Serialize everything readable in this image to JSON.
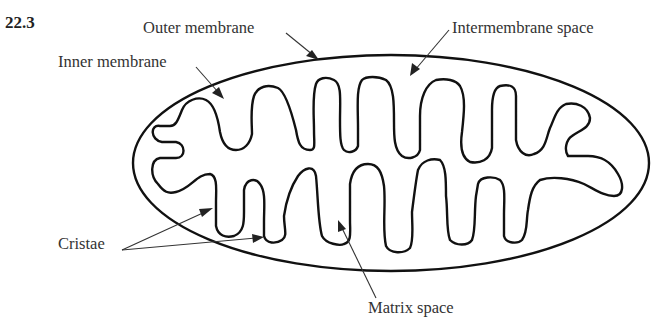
{
  "figure": {
    "number": "22.3"
  },
  "labels": {
    "outer_membrane": "Outer membrane",
    "inner_membrane": "Inner membrane",
    "intermembrane_space": "Intermembrane space",
    "cristae": "Cristae",
    "matrix_space": "Matrix space"
  },
  "colors": {
    "stroke": "#111111",
    "text": "#333333",
    "background": "#ffffff"
  }
}
